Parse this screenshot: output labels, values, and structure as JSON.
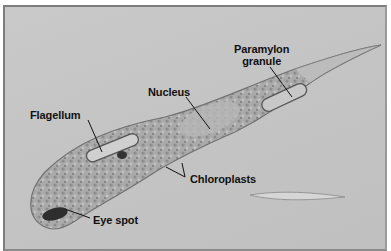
{
  "figure": {
    "background_color": "#c6c6c6",
    "frame_color": "#7d7d7d",
    "labels": [
      {
        "id": "paramylon",
        "text_line1": "Paramylon",
        "text_line2": "granule"
      },
      {
        "id": "nucleus",
        "text": "Nucleus"
      },
      {
        "id": "flagellum",
        "text": "Flagellum"
      },
      {
        "id": "chloroplasts",
        "text": "Chloroplasts"
      },
      {
        "id": "eye-spot",
        "text": "Eye spot"
      }
    ]
  }
}
